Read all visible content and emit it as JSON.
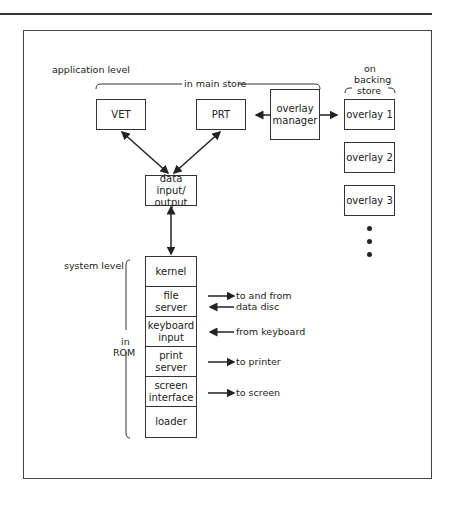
{
  "labels": {
    "application_level": "application level",
    "in_main_store": "in main store",
    "on": "on",
    "backing": "backing",
    "store": "store",
    "system_level": "system level",
    "in": "in",
    "rom": "ROM"
  },
  "app_boxes": {
    "vet": "VET",
    "prt": "PRT",
    "overlay_manager_1": "overlay",
    "overlay_manager_2": "manager",
    "data_io_1": "data input/",
    "data_io_2": "output"
  },
  "overlays": [
    "overlay 1",
    "overlay 2",
    "overlay 3"
  ],
  "system_stack": [
    {
      "l1": "kernel",
      "l2": ""
    },
    {
      "l1": "file",
      "l2": "server"
    },
    {
      "l1": "keyboard",
      "l2": "input"
    },
    {
      "l1": "print",
      "l2": "server"
    },
    {
      "l1": "screen",
      "l2": "interface"
    },
    {
      "l1": "loader",
      "l2": ""
    }
  ],
  "io_notes": {
    "file_1": "to and from",
    "file_2": "data disc",
    "keyboard": "from keyboard",
    "printer": "to printer",
    "screen": "to screen"
  }
}
